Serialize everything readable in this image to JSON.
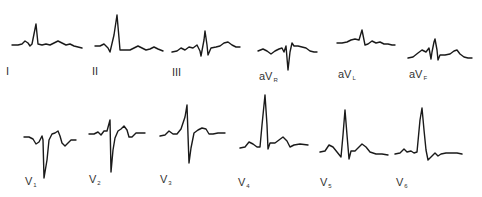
{
  "figure": {
    "stroke_color": "#1a1a1a",
    "background": "#ffffff"
  },
  "leads": [
    {
      "id": "I",
      "label": "I",
      "sub": "",
      "label_pos": [
        6,
        66
      ],
      "points": [
        [
          12,
          45
        ],
        [
          18,
          45
        ],
        [
          22,
          44
        ],
        [
          25,
          41
        ],
        [
          28,
          43
        ],
        [
          30,
          46
        ],
        [
          32,
          44
        ],
        [
          36,
          24
        ],
        [
          38,
          44
        ],
        [
          42,
          45
        ],
        [
          46,
          44
        ],
        [
          50,
          45
        ],
        [
          54,
          43
        ],
        [
          58,
          41
        ],
        [
          62,
          43
        ],
        [
          66,
          45
        ],
        [
          70,
          44
        ],
        [
          74,
          46
        ],
        [
          78,
          47
        ],
        [
          82,
          48
        ]
      ]
    },
    {
      "id": "II",
      "label": "II",
      "sub": "",
      "label_pos": [
        92,
        66
      ],
      "points": [
        [
          95,
          46
        ],
        [
          100,
          46
        ],
        [
          104,
          44
        ],
        [
          108,
          48
        ],
        [
          110,
          52
        ],
        [
          114,
          35
        ],
        [
          117,
          15
        ],
        [
          119,
          38
        ],
        [
          120,
          50
        ],
        [
          126,
          50
        ],
        [
          130,
          50
        ],
        [
          134,
          48
        ],
        [
          138,
          46
        ],
        [
          142,
          48
        ],
        [
          146,
          50
        ],
        [
          150,
          49
        ],
        [
          154,
          47
        ],
        [
          158,
          49
        ],
        [
          163,
          51
        ]
      ]
    },
    {
      "id": "III",
      "label": "III",
      "sub": "",
      "label_pos": [
        172,
        67
      ],
      "points": [
        [
          172,
          52
        ],
        [
          177,
          51
        ],
        [
          181,
          48
        ],
        [
          185,
          50
        ],
        [
          189,
          47
        ],
        [
          193,
          48
        ],
        [
          197,
          45
        ],
        [
          200,
          51
        ],
        [
          201,
          56
        ],
        [
          204,
          40
        ],
        [
          205,
          31
        ],
        [
          207,
          45
        ],
        [
          208,
          55
        ],
        [
          211,
          48
        ],
        [
          216,
          47
        ],
        [
          220,
          46
        ],
        [
          224,
          43
        ],
        [
          228,
          42
        ],
        [
          232,
          45
        ],
        [
          236,
          47
        ],
        [
          240,
          47
        ]
      ]
    },
    {
      "id": "aVR",
      "label": "aV",
      "sub": "R",
      "label_pos": [
        259,
        71
      ],
      "points": [
        [
          258,
          51
        ],
        [
          263,
          49
        ],
        [
          267,
          51
        ],
        [
          271,
          54
        ],
        [
          275,
          51
        ],
        [
          279,
          49
        ],
        [
          282,
          48
        ],
        [
          284,
          52
        ],
        [
          286,
          46
        ],
        [
          288,
          70
        ],
        [
          290,
          52
        ],
        [
          292,
          43
        ],
        [
          294,
          46
        ],
        [
          298,
          46
        ],
        [
          302,
          47
        ],
        [
          306,
          48
        ],
        [
          310,
          51
        ],
        [
          314,
          52
        ],
        [
          317,
          52
        ]
      ]
    },
    {
      "id": "aVL",
      "label": "aV",
      "sub": "L",
      "label_pos": [
        338,
        69
      ],
      "points": [
        [
          337,
          43
        ],
        [
          342,
          43
        ],
        [
          347,
          42
        ],
        [
          351,
          40
        ],
        [
          355,
          39
        ],
        [
          359,
          40
        ],
        [
          362,
          30
        ],
        [
          364,
          40
        ],
        [
          365,
          45
        ],
        [
          368,
          44
        ],
        [
          372,
          41
        ],
        [
          376,
          43
        ],
        [
          380,
          42
        ],
        [
          384,
          44
        ],
        [
          388,
          44
        ],
        [
          392,
          45
        ],
        [
          395,
          45
        ]
      ]
    },
    {
      "id": "aVF",
      "label": "aV",
      "sub": "F",
      "label_pos": [
        409,
        69
      ],
      "points": [
        [
          408,
          58
        ],
        [
          413,
          57
        ],
        [
          418,
          53
        ],
        [
          422,
          50
        ],
        [
          426,
          52
        ],
        [
          429,
          48
        ],
        [
          431,
          59
        ],
        [
          432,
          52
        ],
        [
          434,
          42
        ],
        [
          435,
          39
        ],
        [
          437,
          50
        ],
        [
          438,
          60
        ],
        [
          440,
          55
        ],
        [
          445,
          55
        ],
        [
          450,
          54
        ],
        [
          454,
          51
        ],
        [
          457,
          50
        ],
        [
          460,
          54
        ],
        [
          464,
          57
        ],
        [
          468,
          58
        ],
        [
          472,
          58
        ]
      ]
    },
    {
      "id": "V1",
      "label": "V",
      "sub": "1",
      "label_pos": [
        25,
        176
      ],
      "points": [
        [
          24,
          137
        ],
        [
          29,
          137
        ],
        [
          33,
          139
        ],
        [
          36,
          144
        ],
        [
          39,
          142
        ],
        [
          42,
          136
        ],
        [
          43,
          140
        ],
        [
          44,
          178
        ],
        [
          47,
          160
        ],
        [
          49,
          140
        ],
        [
          52,
          134
        ],
        [
          55,
          133
        ],
        [
          58,
          131
        ],
        [
          60,
          136
        ],
        [
          62,
          143
        ],
        [
          65,
          146
        ],
        [
          68,
          143
        ],
        [
          71,
          140
        ],
        [
          76,
          140
        ]
      ]
    },
    {
      "id": "V2",
      "label": "V",
      "sub": "2",
      "label_pos": [
        89,
        174
      ],
      "points": [
        [
          89,
          134
        ],
        [
          94,
          134
        ],
        [
          98,
          132
        ],
        [
          101,
          135
        ],
        [
          104,
          131
        ],
        [
          107,
          131
        ],
        [
          110,
          120
        ],
        [
          111,
          172
        ],
        [
          113,
          150
        ],
        [
          115,
          138
        ],
        [
          118,
          131
        ],
        [
          121,
          129
        ],
        [
          124,
          126
        ],
        [
          127,
          130
        ],
        [
          129,
          137
        ],
        [
          132,
          137
        ],
        [
          136,
          133
        ],
        [
          140,
          133
        ],
        [
          145,
          133
        ]
      ]
    },
    {
      "id": "V3",
      "label": "V",
      "sub": "3",
      "label_pos": [
        160,
        174
      ],
      "points": [
        [
          160,
          136
        ],
        [
          165,
          135
        ],
        [
          169,
          131
        ],
        [
          173,
          134
        ],
        [
          177,
          134
        ],
        [
          181,
          129
        ],
        [
          185,
          117
        ],
        [
          187,
          105
        ],
        [
          188,
          135
        ],
        [
          189,
          163
        ],
        [
          191,
          148
        ],
        [
          194,
          133
        ],
        [
          198,
          130
        ],
        [
          202,
          128
        ],
        [
          206,
          129
        ],
        [
          209,
          134
        ],
        [
          213,
          134
        ],
        [
          218,
          133
        ],
        [
          225,
          133
        ]
      ]
    },
    {
      "id": "V4",
      "label": "V",
      "sub": "4",
      "label_pos": [
        238,
        177
      ],
      "points": [
        [
          240,
          148
        ],
        [
          245,
          147
        ],
        [
          249,
          142
        ],
        [
          253,
          144
        ],
        [
          257,
          147
        ],
        [
          260,
          147
        ],
        [
          262,
          125
        ],
        [
          265,
          95
        ],
        [
          267,
          125
        ],
        [
          268,
          149
        ],
        [
          270,
          143
        ],
        [
          275,
          143
        ],
        [
          279,
          140
        ],
        [
          283,
          137
        ],
        [
          287,
          141
        ],
        [
          290,
          147
        ],
        [
          294,
          145
        ],
        [
          300,
          144
        ],
        [
          308,
          145
        ]
      ]
    },
    {
      "id": "V5",
      "label": "V",
      "sub": "5",
      "label_pos": [
        320,
        177
      ],
      "points": [
        [
          320,
          152
        ],
        [
          325,
          151
        ],
        [
          329,
          145
        ],
        [
          333,
          147
        ],
        [
          337,
          152
        ],
        [
          341,
          157
        ],
        [
          343,
          135
        ],
        [
          345,
          110
        ],
        [
          347,
          135
        ],
        [
          349,
          159
        ],
        [
          351,
          151
        ],
        [
          355,
          151
        ],
        [
          358,
          148
        ],
        [
          362,
          144
        ],
        [
          366,
          147
        ],
        [
          370,
          152
        ],
        [
          376,
          154
        ],
        [
          382,
          154
        ],
        [
          388,
          155
        ]
      ]
    },
    {
      "id": "V6",
      "label": "V",
      "sub": "6",
      "label_pos": [
        396,
        177
      ],
      "points": [
        [
          395,
          154
        ],
        [
          400,
          153
        ],
        [
          404,
          149
        ],
        [
          407,
          152
        ],
        [
          411,
          151
        ],
        [
          414,
          153
        ],
        [
          417,
          152
        ],
        [
          420,
          120
        ],
        [
          422,
          108
        ],
        [
          424,
          130
        ],
        [
          426,
          150
        ],
        [
          428,
          160
        ],
        [
          431,
          157
        ],
        [
          435,
          153
        ],
        [
          438,
          156
        ],
        [
          441,
          154
        ],
        [
          446,
          153
        ],
        [
          452,
          153
        ],
        [
          457,
          153
        ],
        [
          462,
          154
        ]
      ]
    }
  ]
}
